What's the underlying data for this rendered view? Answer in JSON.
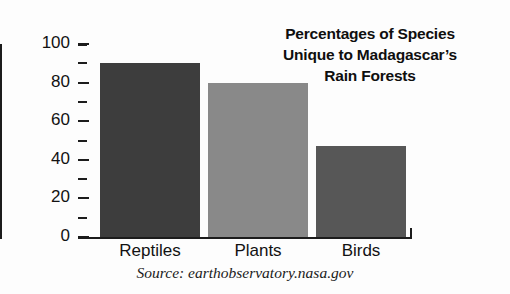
{
  "chart_data": {
    "type": "bar",
    "title_lines": [
      "Percentages of Species",
      "Unique to Madagascar’s",
      "Rain Forests"
    ],
    "categories": [
      "Reptiles",
      "Plants",
      "Birds"
    ],
    "values": [
      90,
      80,
      47
    ],
    "xlabel": "",
    "ylabel": "",
    "ylim": [
      0,
      100
    ],
    "ytick_labels": [
      "0",
      "20",
      "40",
      "60",
      "80",
      "100"
    ],
    "ytick_values": [
      0,
      20,
      40,
      60,
      80,
      100
    ],
    "minor_tick_values": [
      10,
      30,
      50,
      70,
      90
    ],
    "grid": false,
    "legend": false,
    "source": "Source: earthobservatory.nasa.gov",
    "bar_colors": [
      "#3d3d3d",
      "#898989",
      "#575757"
    ],
    "background": "#fdfdfd",
    "axis_color": "#1c1c1c"
  }
}
